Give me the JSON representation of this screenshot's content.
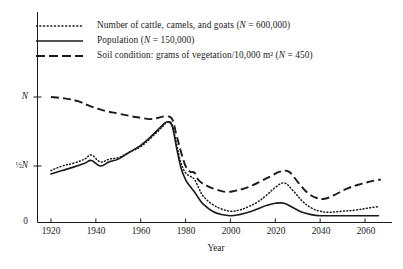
{
  "chart_data": {
    "type": "line",
    "title": "",
    "xlabel": "Year",
    "ylabel": "",
    "xlim": [
      1915,
      2068
    ],
    "ylim": [
      0,
      1.15
    ],
    "grid": false,
    "legend_position": "top-left",
    "y_ticks": [
      {
        "label": "0",
        "value": 0
      },
      {
        "label": "½N",
        "value": 0.5
      },
      {
        "label": "N",
        "value": 1.0
      }
    ],
    "x_ticks": [
      1920,
      1940,
      1960,
      1980,
      2000,
      2020,
      2040,
      2060
    ],
    "series": [
      {
        "name": "Number of cattle, camels, and goats",
        "normalization": "N = 600,000",
        "style": "dotted",
        "x": [
          1920,
          1925,
          1930,
          1935,
          1938,
          1942,
          1946,
          1950,
          1955,
          1960,
          1965,
          1970,
          1972,
          1974,
          1976,
          1978,
          1980,
          1982,
          1984,
          1986,
          1988,
          1992,
          1996,
          2000,
          2004,
          2008,
          2012,
          2016,
          2020,
          2024,
          2028,
          2032,
          2036,
          2040,
          2044,
          2050,
          2056,
          2062,
          2066
        ],
        "values": [
          0.46,
          0.5,
          0.52,
          0.55,
          0.58,
          0.53,
          0.55,
          0.56,
          0.6,
          0.64,
          0.71,
          0.79,
          0.82,
          0.8,
          0.66,
          0.52,
          0.44,
          0.41,
          0.38,
          0.3,
          0.23,
          0.16,
          0.12,
          0.1,
          0.11,
          0.14,
          0.18,
          0.24,
          0.31,
          0.35,
          0.28,
          0.19,
          0.13,
          0.1,
          0.09,
          0.1,
          0.11,
          0.13,
          0.14
        ]
      },
      {
        "name": "Population",
        "normalization": "N = 150,000",
        "style": "solid",
        "x": [
          1920,
          1925,
          1930,
          1935,
          1938,
          1942,
          1946,
          1950,
          1955,
          1960,
          1965,
          1970,
          1972,
          1974,
          1976,
          1978,
          1980,
          1982,
          1984,
          1986,
          1988,
          1992,
          1996,
          2000,
          2004,
          2008,
          2012,
          2016,
          2020,
          2024,
          2028,
          2032,
          2036,
          2040,
          2044,
          2050,
          2056,
          2062,
          2066
        ],
        "values": [
          0.43,
          0.46,
          0.49,
          0.52,
          0.54,
          0.5,
          0.53,
          0.55,
          0.6,
          0.65,
          0.72,
          0.8,
          0.82,
          0.79,
          0.63,
          0.48,
          0.38,
          0.32,
          0.27,
          0.21,
          0.16,
          0.1,
          0.07,
          0.06,
          0.07,
          0.09,
          0.12,
          0.15,
          0.17,
          0.17,
          0.13,
          0.09,
          0.07,
          0.06,
          0.06,
          0.06,
          0.06,
          0.06,
          0.06
        ]
      },
      {
        "name": "Soil condition: grams of vegetation/10,000 m²",
        "normalization": "N = 450",
        "style": "dashed",
        "x": [
          1920,
          1926,
          1932,
          1938,
          1944,
          1950,
          1956,
          1960,
          1964,
          1968,
          1971,
          1974,
          1976,
          1978,
          1980,
          1982,
          1984,
          1986,
          1990,
          1994,
          1998,
          2002,
          2006,
          2010,
          2014,
          2018,
          2022,
          2026,
          2030,
          2034,
          2038,
          2042,
          2046,
          2052,
          2058,
          2064,
          2067
        ],
        "values": [
          1.0,
          0.99,
          0.97,
          0.93,
          0.9,
          0.88,
          0.86,
          0.85,
          0.84,
          0.85,
          0.86,
          0.84,
          0.72,
          0.6,
          0.5,
          0.45,
          0.44,
          0.37,
          0.32,
          0.29,
          0.27,
          0.28,
          0.3,
          0.33,
          0.37,
          0.41,
          0.45,
          0.45,
          0.36,
          0.27,
          0.22,
          0.21,
          0.24,
          0.3,
          0.34,
          0.37,
          0.38
        ]
      }
    ]
  },
  "legend": {
    "items": [
      {
        "icon": "dotted-line-icon",
        "text": "Number of cattle, camels, and goats (N  = 600,000)"
      },
      {
        "icon": "solid-line-icon",
        "text": "Population (N  = 150,000)"
      },
      {
        "icon": "dashed-line-icon",
        "text": "Soil condition: grams of vegetation/10,000 m² (N  = 450)"
      }
    ]
  },
  "axes": {
    "x_title": "Year",
    "x_tick_labels": [
      "1920",
      "1940",
      "1960",
      "1980",
      "2000",
      "2020",
      "2040",
      "2060"
    ],
    "y_tick_labels": [
      "0",
      "½N",
      "N"
    ]
  },
  "colors": {
    "ink": "#1a1a1a",
    "background": "#ffffff"
  }
}
